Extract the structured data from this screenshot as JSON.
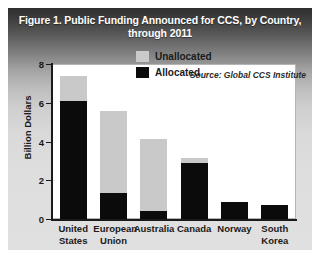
{
  "figure": {
    "title_line_1": "Figure 1. Public Funding Announced for CCS, by Country,",
    "title_line_2": "through 2011",
    "source_note": "Source: Global CCS Institute"
  },
  "colors": {
    "allocated": "#0b0b0b",
    "unallocated": "#c9c9c9",
    "panel_background": "#ffffff",
    "axis": "#1a1a1a",
    "title_text": "#ffffff"
  },
  "chart_data": {
    "type": "bar",
    "stacked": true,
    "title": "Figure 1. Public Funding Announced for CCS, by Country, through 2011",
    "xlabel": "",
    "ylabel": "Billion Dollars",
    "ylim": [
      0,
      8
    ],
    "yticks": [
      0,
      2,
      4,
      6,
      8
    ],
    "ytick_labels": [
      "0",
      "2",
      "4",
      "6",
      "8"
    ],
    "grid": false,
    "legend_position": "inside-upper-center",
    "categories": [
      "United States",
      "European Union",
      "Australia",
      "Canada",
      "Norway",
      "South Korea"
    ],
    "category_lines": [
      [
        "United",
        "States"
      ],
      [
        "European",
        "Union"
      ],
      [
        "Australia"
      ],
      [
        "Canada"
      ],
      [
        "Norway"
      ],
      [
        "South",
        "Korea"
      ]
    ],
    "series": [
      {
        "name": "Allocated",
        "color": "#0b0b0b",
        "values": [
          6.1,
          1.35,
          0.4,
          2.9,
          0.9,
          0.7
        ]
      },
      {
        "name": "Unallocated",
        "color": "#c9c9c9",
        "values": [
          1.3,
          4.25,
          3.7,
          0.25,
          0.0,
          0.0
        ]
      }
    ],
    "totals": [
      7.4,
      5.6,
      4.1,
      3.15,
      0.9,
      0.7
    ],
    "annotations": [
      "Source: Global CCS Institute"
    ]
  },
  "legend": {
    "items": [
      {
        "label": "Unallocated",
        "color": "#c9c9c9"
      },
      {
        "label": "Allocated",
        "color": "#0b0b0b"
      }
    ]
  }
}
